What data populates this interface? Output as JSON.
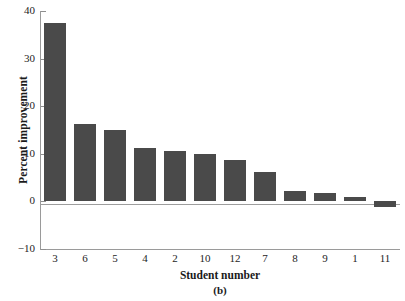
{
  "chart_data": {
    "type": "bar",
    "title": "",
    "panel_label": "(b)",
    "xlabel": "Student number",
    "ylabel": "Percent improvement",
    "categories": [
      "3",
      "6",
      "5",
      "4",
      "2",
      "10",
      "12",
      "7",
      "8",
      "9",
      "1",
      "11"
    ],
    "values": [
      37.4,
      16.2,
      15.1,
      11.2,
      10.6,
      9.9,
      8.8,
      6.2,
      2.2,
      1.7,
      0.9,
      -1.2
    ],
    "ylim": [
      -10,
      40
    ],
    "yticks": [
      40,
      30,
      20,
      10,
      0,
      -10
    ],
    "ytick_labels": [
      "40",
      "30",
      "20",
      "10",
      "0",
      "−10"
    ],
    "grid": false,
    "legend": false,
    "bar_color": "#4a4a4a",
    "axis_color": "#9a9a9a",
    "text_color": "#242424"
  }
}
